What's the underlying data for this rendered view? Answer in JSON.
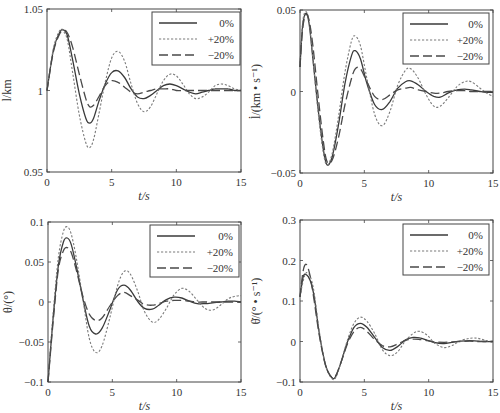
{
  "legend": {
    "entries": [
      {
        "label": "0%",
        "style": "solid"
      },
      {
        "label": "+20%",
        "style": "dotted"
      },
      {
        "label": "−20%",
        "style": "dashed"
      }
    ]
  },
  "colors": {
    "solid": "#3a3a3a",
    "dotted": "#7a7a7a",
    "dashed": "#4a4a4a",
    "frame": "#444444"
  },
  "chart_data": [
    {
      "id": "l",
      "type": "line",
      "title": "",
      "xlabel": "t/s",
      "ylabel": "l/km",
      "xlim": [
        0,
        15
      ],
      "ylim": [
        0.95,
        1.05
      ],
      "xticks": [
        0,
        5,
        10,
        15
      ],
      "yticks": [
        0.95,
        1,
        1.05
      ],
      "ytick_labels": [
        "0.95",
        "1",
        "1.05"
      ],
      "grid": false,
      "legend_position": "upper right",
      "frame": {
        "left": 47,
        "top": 9,
        "right": 241,
        "bottom": 172
      },
      "legend_box": {
        "x": 152,
        "y": 12,
        "w": 88,
        "h": 53
      },
      "x": [
        0,
        0.5,
        1,
        1.3,
        1.6,
        2,
        2.5,
        3,
        3.3,
        3.6,
        4,
        4.5,
        5,
        5.5,
        6,
        6.5,
        7,
        7.5,
        8,
        8.5,
        9,
        9.5,
        10,
        10.5,
        11,
        11.5,
        12,
        12.5,
        13,
        13.5,
        14,
        14.5,
        15
      ],
      "series": [
        {
          "name": "0%",
          "style": "solid",
          "values": [
            1.0,
            1.025,
            1.036,
            1.037,
            1.033,
            1.018,
            0.998,
            0.983,
            0.98,
            0.983,
            0.993,
            1.004,
            1.011,
            1.012,
            1.008,
            1.001,
            0.996,
            0.995,
            0.997,
            1.0,
            1.003,
            1.004,
            1.003,
            1.001,
            0.999,
            0.998,
            0.999,
            1.0,
            1.001,
            1.001,
            1.001,
            1.0,
            1.0
          ]
        },
        {
          "name": "+20%",
          "style": "dotted",
          "values": [
            1.0,
            1.026,
            1.037,
            1.036,
            1.03,
            1.01,
            0.985,
            0.968,
            0.965,
            0.97,
            0.985,
            1.005,
            1.02,
            1.024,
            1.018,
            1.004,
            0.992,
            0.987,
            0.99,
            0.998,
            1.006,
            1.01,
            1.009,
            1.004,
            0.998,
            0.995,
            0.996,
            0.999,
            1.003,
            1.004,
            1.003,
            1.001,
            1.0
          ]
        },
        {
          "name": "−20%",
          "style": "dashed",
          "values": [
            1.0,
            1.024,
            1.035,
            1.037,
            1.035,
            1.026,
            1.01,
            0.995,
            0.99,
            0.991,
            0.996,
            1.003,
            1.006,
            1.005,
            1.002,
            0.999,
            0.998,
            0.999,
            1.0,
            1.001,
            1.001,
            1.001,
            1.0,
            1.0,
            1.0,
            1.0,
            1.0,
            1.0,
            1.0,
            1.0,
            1.0,
            1.0,
            1.0
          ]
        }
      ]
    },
    {
      "id": "ldot",
      "type": "line",
      "title": "",
      "xlabel": "t/s",
      "ylabel": "l̇/(km • s⁻¹)",
      "xlim": [
        0,
        15
      ],
      "ylim": [
        -0.05,
        0.05
      ],
      "xticks": [
        0,
        5,
        10,
        15
      ],
      "yticks": [
        -0.05,
        0,
        0.05
      ],
      "ytick_labels": [
        "−0.05",
        "0",
        "0.05"
      ],
      "grid": false,
      "legend_position": "upper right",
      "frame": {
        "left": 300,
        "top": 10,
        "right": 493,
        "bottom": 173
      },
      "legend_box": {
        "x": 403,
        "y": 13,
        "w": 86,
        "h": 51
      },
      "x": [
        0,
        0.2,
        0.45,
        0.7,
        1,
        1.4,
        1.8,
        2.1,
        2.5,
        3,
        3.5,
        4,
        4.3,
        4.7,
        5.2,
        5.8,
        6.4,
        7,
        7.6,
        8.2,
        8.6,
        9.2,
        9.8,
        10.4,
        10.9,
        11.5,
        12.2,
        12.8,
        13.3,
        14,
        14.5,
        15
      ],
      "series": [
        {
          "name": "0%",
          "style": "solid",
          "values": [
            0.015,
            0.04,
            0.048,
            0.042,
            0.02,
            -0.01,
            -0.035,
            -0.045,
            -0.04,
            -0.02,
            0.005,
            0.022,
            0.025,
            0.02,
            0.005,
            -0.008,
            -0.011,
            -0.006,
            0.002,
            0.006,
            0.0065,
            0.004,
            0.0,
            -0.003,
            -0.0035,
            -0.001,
            0.001,
            0.0015,
            0.001,
            0.0,
            -0.0005,
            -0.0005
          ]
        },
        {
          "name": "+20%",
          "style": "dotted",
          "values": [
            0.015,
            0.042,
            0.049,
            0.043,
            0.02,
            -0.012,
            -0.037,
            -0.045,
            -0.038,
            -0.015,
            0.012,
            0.031,
            0.034,
            0.028,
            0.008,
            -0.014,
            -0.021,
            -0.012,
            0.004,
            0.013,
            0.014,
            0.008,
            -0.002,
            -0.009,
            -0.009,
            -0.004,
            0.003,
            0.006,
            0.006,
            0.002,
            -0.001,
            -0.003
          ]
        },
        {
          "name": "−20%",
          "style": "dashed",
          "values": [
            0.015,
            0.038,
            0.047,
            0.044,
            0.028,
            -0.002,
            -0.03,
            -0.043,
            -0.042,
            -0.028,
            -0.008,
            0.008,
            0.014,
            0.014,
            0.006,
            -0.003,
            -0.005,
            -0.002,
            0.001,
            0.002,
            0.0025,
            0.001,
            0.0,
            -0.001,
            -0.001,
            0.0,
            0.0005,
            0.0005,
            0.0,
            0.0,
            0.0,
            0.0
          ]
        }
      ]
    },
    {
      "id": "theta",
      "type": "line",
      "title": "",
      "xlabel": "t/s",
      "ylabel": "θ/(°)",
      "xlim": [
        0,
        15
      ],
      "ylim": [
        -0.1,
        0.1
      ],
      "xticks": [
        0,
        5,
        10,
        15
      ],
      "yticks": [
        -0.1,
        -0.05,
        0,
        0.05,
        0.1
      ],
      "ytick_labels": [
        "−0.1",
        "−0.05",
        "0",
        "0.05",
        "0.1"
      ],
      "grid": false,
      "legend_position": "upper right",
      "frame": {
        "left": 48,
        "top": 222,
        "right": 241,
        "bottom": 382
      },
      "legend_box": {
        "x": 150,
        "y": 225,
        "w": 89,
        "h": 52
      },
      "x": [
        0,
        0.4,
        0.8,
        1.2,
        1.5,
        1.8,
        2.2,
        2.7,
        3.2,
        3.7,
        4.2,
        4.8,
        5.4,
        5.9,
        6.4,
        7,
        7.5,
        8.1,
        8.6,
        9.2,
        9.8,
        10.4,
        11,
        11.6,
        12.2,
        12.8,
        13.4,
        14,
        14.5,
        15
      ],
      "series": [
        {
          "name": "0%",
          "style": "solid",
          "values": [
            -0.1,
            -0.02,
            0.045,
            0.075,
            0.08,
            0.072,
            0.045,
            0.005,
            -0.03,
            -0.04,
            -0.033,
            -0.01,
            0.015,
            0.021,
            0.015,
            0.0,
            -0.008,
            -0.009,
            -0.004,
            0.003,
            0.006,
            0.005,
            0.001,
            -0.002,
            -0.002,
            -0.001,
            0.0,
            0.001,
            0.001,
            0.0
          ]
        },
        {
          "name": "+20%",
          "style": "dotted",
          "values": [
            -0.1,
            -0.015,
            0.055,
            0.088,
            0.094,
            0.085,
            0.055,
            0.005,
            -0.045,
            -0.063,
            -0.055,
            -0.02,
            0.02,
            0.038,
            0.035,
            0.012,
            -0.012,
            -0.025,
            -0.022,
            -0.008,
            0.009,
            0.017,
            0.013,
            0.002,
            -0.008,
            -0.01,
            -0.004,
            0.004,
            0.007,
            0.008
          ]
        },
        {
          "name": "−20%",
          "style": "dashed",
          "values": [
            -0.1,
            -0.025,
            0.04,
            0.064,
            0.068,
            0.062,
            0.04,
            0.008,
            -0.015,
            -0.023,
            -0.02,
            -0.005,
            0.008,
            0.012,
            0.008,
            0.002,
            -0.003,
            -0.004,
            -0.002,
            0.001,
            0.002,
            0.002,
            0.001,
            0.0,
            0.0,
            0.0,
            0.0,
            0.0,
            0.0,
            0.0
          ]
        }
      ]
    },
    {
      "id": "thetadot",
      "type": "line",
      "title": "",
      "xlabel": "t/s",
      "ylabel": "θ̇/(° • s⁻¹)",
      "xlim": [
        0,
        15
      ],
      "ylim": [
        -0.1,
        0.3
      ],
      "xticks": [
        0,
        5,
        10,
        15
      ],
      "yticks": [
        -0.1,
        0,
        0.1,
        0.2,
        0.3
      ],
      "ytick_labels": [
        "−0.1",
        "0",
        "0.1",
        "0.2",
        "0.3"
      ],
      "grid": false,
      "legend_position": "upper right",
      "frame": {
        "left": 300,
        "top": 220,
        "right": 493,
        "bottom": 382
      },
      "legend_box": {
        "x": 403,
        "y": 224,
        "w": 86,
        "h": 51
      },
      "x": [
        0,
        0.25,
        0.5,
        0.8,
        1.1,
        1.5,
        2.0,
        2.5,
        2.8,
        3.2,
        3.7,
        4.2,
        4.7,
        5.2,
        5.8,
        6.4,
        7.0,
        7.6,
        8.2,
        8.8,
        9.3,
        9.9,
        10.5,
        11.2,
        11.8,
        12.5,
        13.2,
        13.8,
        14.4,
        15
      ],
      "series": [
        {
          "name": "0%",
          "style": "solid",
          "values": [
            0.11,
            0.16,
            0.165,
            0.15,
            0.11,
            0.02,
            -0.06,
            -0.09,
            -0.085,
            -0.05,
            0.0,
            0.035,
            0.045,
            0.035,
            0.01,
            -0.015,
            -0.022,
            -0.012,
            0.004,
            0.01,
            0.009,
            0.003,
            -0.003,
            -0.005,
            -0.002,
            0.001,
            0.002,
            0.001,
            0.0,
            0.0
          ]
        },
        {
          "name": "+20%",
          "style": "dotted",
          "values": [
            0.11,
            0.15,
            0.17,
            0.16,
            0.12,
            0.025,
            -0.06,
            -0.092,
            -0.088,
            -0.05,
            0.005,
            0.045,
            0.06,
            0.05,
            0.02,
            -0.02,
            -0.035,
            -0.025,
            0.002,
            0.02,
            0.025,
            0.015,
            -0.005,
            -0.015,
            -0.01,
            0.002,
            0.008,
            0.008,
            0.003,
            -0.002
          ]
        },
        {
          "name": "−20%",
          "style": "dashed",
          "values": [
            0.11,
            0.175,
            0.19,
            0.16,
            0.1,
            0.015,
            -0.06,
            -0.09,
            -0.083,
            -0.05,
            -0.005,
            0.025,
            0.035,
            0.025,
            0.005,
            -0.01,
            -0.013,
            -0.006,
            0.003,
            0.006,
            0.005,
            0.002,
            -0.001,
            -0.002,
            -0.001,
            0.0,
            0.001,
            0.0,
            0.0,
            0.0
          ]
        }
      ]
    }
  ]
}
